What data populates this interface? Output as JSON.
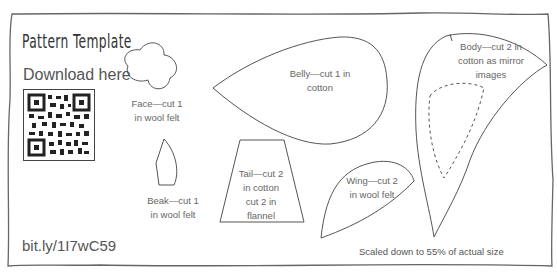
{
  "header": {
    "title": "Pattern Template",
    "download_label": "Download here"
  },
  "qr_code": {
    "icon": "qr-code-icon"
  },
  "short_url": "bit.ly/1I7wC59",
  "pieces": {
    "face": {
      "line1": "Face—cut 1",
      "line2": "in wool felt"
    },
    "beak": {
      "line1": "Beak—cut 1",
      "line2": "in wool felt"
    },
    "belly": {
      "line1": "Belly—cut 1 in",
      "line2": "cotton"
    },
    "tail": {
      "line1": "Tail—cut 2",
      "line2": "in cotton",
      "line3": "cut 2 in",
      "line4": "flannel"
    },
    "wing": {
      "line1": "Wing—cut 2",
      "line2": "in wool felt"
    },
    "body": {
      "line1": "Body—cut 2 in",
      "line2": "cotton as mirror",
      "line3": "images"
    }
  },
  "footer": {
    "scale_note": "Scaled down to 55% of actual size"
  },
  "colors": {
    "outline": "#555555",
    "text": "#666666"
  }
}
